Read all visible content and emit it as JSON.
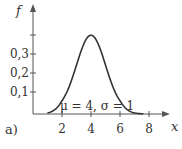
{
  "chart_data": {
    "type": "line",
    "title": "",
    "xlabel": "x",
    "ylabel": "f",
    "panel_label": "a)",
    "annotation": "μ = 4, σ = 1",
    "xlim": [
      0,
      9
    ],
    "ylim": [
      0,
      0.45
    ],
    "x_ticks": [
      2,
      4,
      6,
      8
    ],
    "x_tick_labels": [
      "2",
      "4",
      "6",
      "8"
    ],
    "y_ticks": [
      0.1,
      0.2,
      0.3,
      0.4
    ],
    "y_tick_labels": [
      "0,1",
      "0,2",
      "0,3",
      ""
    ],
    "grid": false,
    "legend": null,
    "series": [
      {
        "name": "Normal pdf (μ=4, σ=1)",
        "mu": 4,
        "sigma": 1,
        "x_range": [
          1,
          7.6
        ],
        "x": [
          1,
          1.5,
          2,
          2.5,
          3,
          3.5,
          4,
          4.5,
          5,
          5.5,
          6,
          6.5,
          7,
          7.5
        ],
        "values": [
          0.004,
          0.018,
          0.054,
          0.13,
          0.242,
          0.352,
          0.399,
          0.352,
          0.242,
          0.13,
          0.054,
          0.018,
          0.004,
          0.001
        ]
      }
    ],
    "colors": {
      "axis": "#555555",
      "curve": "#333333",
      "text": "#333333"
    }
  },
  "labels": {
    "y_axis": "f",
    "x_axis": "x",
    "panel": "a)",
    "annotation_mu": "μ = 4, σ = 1",
    "x_ticks": [
      "2",
      "4",
      "6",
      "8"
    ],
    "y_ticks": [
      "0,1",
      "0,2",
      "0,3"
    ]
  }
}
